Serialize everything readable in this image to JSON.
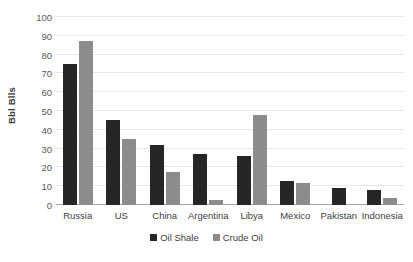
{
  "chart_data": {
    "type": "bar",
    "title": "",
    "subtitle": "",
    "xlabel": "",
    "ylabel": "Bbl Blls",
    "ylim": [
      0,
      100
    ],
    "yticks": [
      0,
      10,
      20,
      30,
      40,
      50,
      60,
      70,
      80,
      90,
      100
    ],
    "ytick_labels": [
      "0",
      "10",
      "20",
      "30",
      "40",
      "50",
      "60",
      "70",
      "80",
      "90",
      "100"
    ],
    "grid": true,
    "grid_axis": "y",
    "legend_position": "bottom-center",
    "categories": [
      "Russia",
      "US",
      "China",
      "Argentina",
      "Libya",
      "Mexico",
      "Pakistan",
      "Indonesia"
    ],
    "series": [
      {
        "name": "Oil Shale",
        "color": "#262626",
        "values": [
          75,
          45,
          32,
          27,
          26,
          13,
          9,
          8
        ]
      },
      {
        "name": "Crude Oil",
        "color": "#8c8c8c",
        "values": [
          87,
          35,
          17.5,
          2.5,
          48,
          11.5,
          0,
          3.5
        ]
      }
    ],
    "annotations": []
  },
  "colors": {
    "background": "#ffffff",
    "gridline": "#e6e6e6",
    "axis_line": "#a6a6a6",
    "text": "#404040",
    "tick_text": "#595959",
    "series_oil_shale": "#262626",
    "series_crude_oil": "#8c8c8c"
  }
}
